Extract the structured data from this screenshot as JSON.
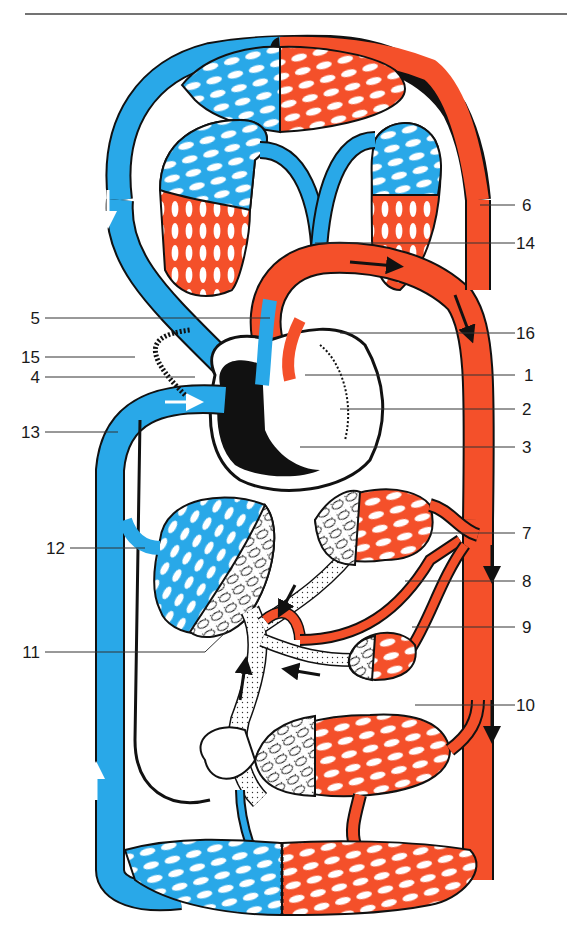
{
  "diagram": {
    "type": "circulatory-system",
    "colors": {
      "deoxygenated": "#29A8E8",
      "oxygenated": "#F4502A",
      "outline": "#111111",
      "leader": "#333333",
      "rule": "#444444",
      "background": "#FFFFFF"
    },
    "labels_left": [
      {
        "id": "5",
        "text": "5",
        "y": 318
      },
      {
        "id": "15",
        "text": "15",
        "y": 357
      },
      {
        "id": "4",
        "text": "4",
        "y": 377
      },
      {
        "id": "13",
        "text": "13",
        "y": 432
      },
      {
        "id": "12",
        "text": "12",
        "y": 548
      },
      {
        "id": "11",
        "text": "11",
        "y": 652
      }
    ],
    "labels_right": [
      {
        "id": "6",
        "text": "6",
        "y": 205
      },
      {
        "id": "14",
        "text": "14",
        "y": 243
      },
      {
        "id": "16",
        "text": "16",
        "y": 333
      },
      {
        "id": "1",
        "text": "1",
        "y": 375
      },
      {
        "id": "2",
        "text": "2",
        "y": 409
      },
      {
        "id": "3",
        "text": "3",
        "y": 447
      },
      {
        "id": "7",
        "text": "7",
        "y": 533
      },
      {
        "id": "8",
        "text": "8",
        "y": 581
      },
      {
        "id": "9",
        "text": "9",
        "y": 627
      },
      {
        "id": "10",
        "text": "10",
        "y": 705
      }
    ]
  }
}
